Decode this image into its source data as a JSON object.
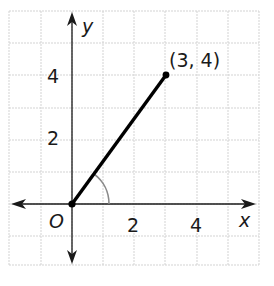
{
  "diagram": {
    "type": "coordinate-plane",
    "axes": {
      "x_label": "x",
      "y_label": "y",
      "origin_label": "O",
      "x_ticks": [
        "2",
        "4"
      ],
      "y_ticks": [
        "2",
        "4"
      ]
    },
    "segment": {
      "from": [
        0,
        0
      ],
      "to": [
        3,
        4
      ]
    },
    "point_label": "(3, 4)",
    "angle_arc": "angle between positive x-axis and segment",
    "colors": {
      "grid": "#d0d0d0",
      "axis": "#1a1a1a",
      "segment": "#000000",
      "arc": "#888888"
    }
  }
}
